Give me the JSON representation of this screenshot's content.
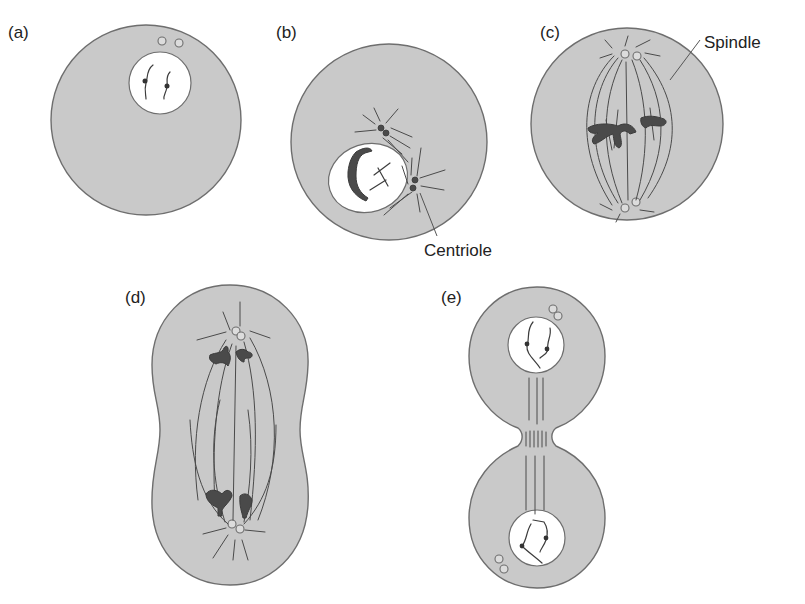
{
  "figure": {
    "panels": [
      {
        "id": "a",
        "label": "(a)",
        "label_pos": [
          8,
          38
        ],
        "description": "Interphase cell with nucleus and pair of centrioles"
      },
      {
        "id": "b",
        "label": "(b)",
        "label_pos": [
          276,
          38
        ],
        "description": "Prophase: centrioles separating, spindle fibers forming, chromosomes condensing"
      },
      {
        "id": "c",
        "label": "(c)",
        "label_pos": [
          540,
          38
        ],
        "description": "Metaphase: chromosomes aligned on spindle between poles"
      },
      {
        "id": "d",
        "label": "(d)",
        "label_pos": [
          125,
          303
        ],
        "description": "Anaphase: chromosomes pulled to opposite poles, cell elongating"
      },
      {
        "id": "e",
        "label": "(e)",
        "label_pos": [
          441,
          303
        ],
        "description": "Telophase / cytokinesis: two daughter nuclei, cleavage furrow"
      }
    ],
    "annotations": [
      {
        "text": "Spindle",
        "pos": [
          704,
          48
        ],
        "points_to": [
          670,
          80
        ],
        "panel": "c"
      },
      {
        "text": "Centriole",
        "pos": [
          424,
          256
        ],
        "points_to": [
          420,
          193
        ],
        "panel": "b"
      }
    ]
  },
  "colors": {
    "cytoplasm": "#c9c9c9",
    "outline": "#6e6e6e",
    "nucleus": "#ffffff",
    "chromosome": "#4a4a4a",
    "text": "#222222"
  }
}
